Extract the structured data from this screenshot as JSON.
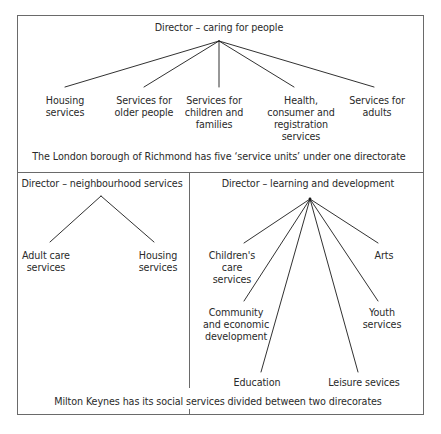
{
  "top_panel": {
    "director": "Director – caring for people",
    "units": [
      {
        "line1": "Housing",
        "line2": "services",
        "line3": "",
        "line4": ""
      },
      {
        "line1": "Services for",
        "line2": "older people",
        "line3": "",
        "line4": ""
      },
      {
        "line1": "Services for",
        "line2": "children and",
        "line3": "families",
        "line4": ""
      },
      {
        "line1": "Health,",
        "line2": "consumer and",
        "line3": "registration",
        "line4": "services"
      },
      {
        "line1": "Services for",
        "line2": "adults",
        "line3": "",
        "line4": ""
      }
    ],
    "caption": "The London borough of Richmond has five ‘service units’ under one directorate"
  },
  "bottom_left_panel": {
    "director": "Director – neighbourhood services",
    "units": [
      {
        "line1": "Adult care",
        "line2": "services"
      },
      {
        "line1": "Housing",
        "line2": "services"
      }
    ]
  },
  "bottom_right_panel": {
    "director": "Director – learning and development",
    "units": [
      {
        "line1": "Children's",
        "line2": "care",
        "line3": "services"
      },
      {
        "line1": "Community",
        "line2": "and economic",
        "line3": "development"
      },
      {
        "line1": "Education",
        "line2": "",
        "line3": ""
      },
      {
        "line1": "Leisure sevices",
        "line2": "",
        "line3": ""
      },
      {
        "line1": "Youth",
        "line2": "services",
        "line3": ""
      },
      {
        "line1": "Arts",
        "line2": "",
        "line3": ""
      }
    ]
  },
  "bottom_caption": "Milton Keynes has its social services divided between two direcorates",
  "colors": {
    "line": "#1a1a1a",
    "border": "#6a6a6a",
    "text": "#2a2a2a",
    "background": "#ffffff"
  }
}
